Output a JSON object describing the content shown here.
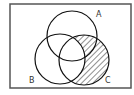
{
  "diagram": {
    "type": "venn",
    "universe": {
      "x": 10,
      "y": 4,
      "width": 121,
      "height": 84
    },
    "sets": [
      {
        "id": "A",
        "label": "A",
        "cx": 72,
        "cy": 36,
        "r": 25,
        "label_x": 96,
        "label_y": 17
      },
      {
        "id": "B",
        "label": "B",
        "cx": 60,
        "cy": 59,
        "r": 25,
        "label_x": 29,
        "label_y": 83
      },
      {
        "id": "C",
        "label": "C",
        "cx": 84,
        "cy": 60,
        "r": 25,
        "label_x": 105,
        "label_y": 83
      }
    ],
    "shaded_region": "C minus B",
    "shading": "diagonal-hatch",
    "colors": {
      "stroke": "#111111",
      "border": "#555555",
      "hatch": "#333333",
      "background": "#ffffff"
    }
  }
}
